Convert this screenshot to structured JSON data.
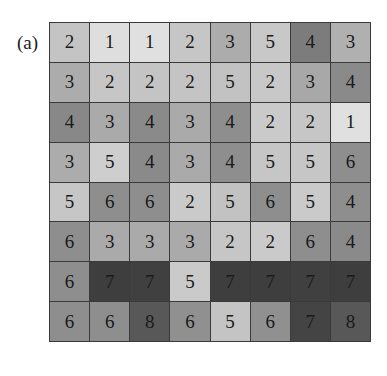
{
  "figure": {
    "label": "(a)",
    "rows": 8,
    "cols": 8,
    "values": [
      [
        2,
        1,
        1,
        2,
        3,
        5,
        4,
        3
      ],
      [
        3,
        2,
        2,
        2,
        5,
        2,
        3,
        4
      ],
      [
        4,
        3,
        4,
        3,
        4,
        2,
        2,
        1
      ],
      [
        3,
        5,
        4,
        3,
        4,
        5,
        5,
        6
      ],
      [
        5,
        6,
        6,
        2,
        5,
        6,
        5,
        4
      ],
      [
        6,
        3,
        3,
        3,
        2,
        2,
        6,
        4
      ],
      [
        6,
        7,
        7,
        5,
        7,
        7,
        7,
        7
      ],
      [
        6,
        6,
        8,
        6,
        5,
        6,
        7,
        8
      ]
    ],
    "shades": [
      [
        "#c4c4c4",
        "#dedede",
        "#e0e0e0",
        "#c6c6c6",
        "#acacac",
        "#c8c8c8",
        "#7c7c7c",
        "#b0b0b0"
      ],
      [
        "#acacac",
        "#c6c6c6",
        "#c4c4c4",
        "#c4c4c4",
        "#c2c2c2",
        "#c8c8c8",
        "#a8a8a8",
        "#8a8a8a"
      ],
      [
        "#888888",
        "#aaaaaa",
        "#8a8a8a",
        "#aaaaaa",
        "#8e8e8e",
        "#cacaca",
        "#c6c6c6",
        "#e0e0e0"
      ],
      [
        "#acacac",
        "#cecece",
        "#8a8a8a",
        "#aaaaaa",
        "#8e8e8e",
        "#c6c6c6",
        "#c6c6c6",
        "#8e8e8e"
      ],
      [
        "#c6c6c6",
        "#8e8e8e",
        "#8e8e8e",
        "#cacaca",
        "#c2c2c2",
        "#8e8e8e",
        "#cacaca",
        "#8e8e8e"
      ],
      [
        "#8e8e8e",
        "#aaaaaa",
        "#aaaaaa",
        "#aaaaaa",
        "#c6c6c6",
        "#cacaca",
        "#8e8e8e",
        "#8a8a8a"
      ],
      [
        "#8e8e8e",
        "#3e3e3e",
        "#404040",
        "#cacaca",
        "#3e3e3e",
        "#3e3e3e",
        "#404040",
        "#3e3e3e"
      ],
      [
        "#8e8e8e",
        "#8e8e8e",
        "#585858",
        "#909090",
        "#c4c4c4",
        "#909090",
        "#444444",
        "#585858"
      ]
    ]
  }
}
